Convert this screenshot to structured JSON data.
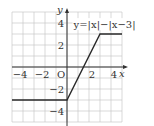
{
  "chart_data": {
    "type": "line",
    "title": "y=|x|−|x−3|",
    "xlabel": "x",
    "ylabel": "y",
    "origin_label": "O",
    "xlim": [
      -5,
      5
    ],
    "ylim": [
      -5,
      5
    ],
    "grid": true,
    "x_ticks": [
      -4,
      -2,
      2,
      4
    ],
    "y_ticks": [
      4,
      2,
      -2,
      -4
    ],
    "x_tick_labels": [
      "−4",
      "−2",
      "2",
      "4"
    ],
    "y_tick_labels": [
      "4",
      "2",
      "−2",
      "−4"
    ],
    "series": [
      {
        "name": "y=|x|−|x−3|",
        "x": [
          -5,
          0,
          3,
          5
        ],
        "y": [
          -3,
          -3,
          3,
          3
        ]
      }
    ],
    "annotation": {
      "text": "y=|x|−|x−3|",
      "placement": "top-right"
    }
  }
}
